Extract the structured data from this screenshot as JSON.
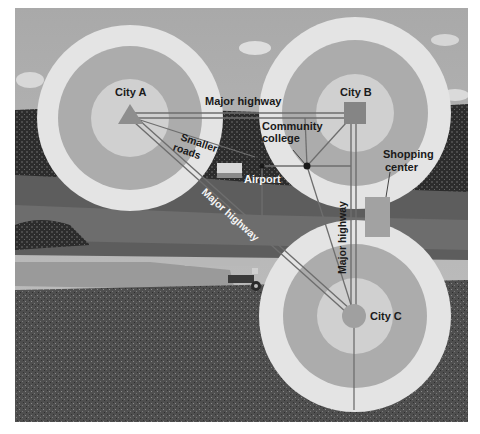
{
  "colors": {
    "ring_outer": "#e6e6e6",
    "ring_mid": "#a9a9a9",
    "ring_inner": "#d2d2d2",
    "city_marker": "#8e8e8e",
    "road": "#6e6e6e",
    "road_light": "#cfcfcf",
    "sky": "#b4b4b4",
    "field_dark": "#4a4a4a",
    "field_mid": "#6a6a6a",
    "tree": "#2e2e2e"
  },
  "cities": [
    {
      "id": "A",
      "label": "City A",
      "marker": "triangle"
    },
    {
      "id": "B",
      "label": "City B",
      "marker": "square"
    },
    {
      "id": "C",
      "label": "City C",
      "marker": "circle"
    }
  ],
  "labels": {
    "major_highway_top": "Major highway",
    "major_highway_diagonal": "Major highway",
    "major_highway_vertical": "Major highway",
    "smaller_roads_line1": "Smaller",
    "smaller_roads_line2": "roads",
    "community_college_line1": "Community",
    "community_college_line2": "college",
    "airport": "Airport",
    "shopping_center_line1": "Shopping",
    "shopping_center_line2": "center"
  }
}
